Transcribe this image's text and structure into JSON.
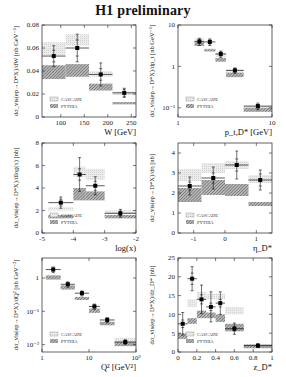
{
  "title": "H1 preliminary",
  "legend": {
    "cascade": "CASCADE",
    "pythia": "PYTHIA"
  },
  "colors": {
    "cascade": "#e4e4e4",
    "pythia": "#9a9a9a",
    "data": "#000000",
    "frame": "#222222"
  },
  "chart_data": [
    {
      "type": "bar",
      "id": "W",
      "title": "",
      "xlabel": "W [GeV]",
      "ylabel": "dσ_vis(ep→D*X)/dW [nb GeV⁻¹]",
      "xlim": [
        60,
        260
      ],
      "ylim": [
        0,
        0.08
      ],
      "xscale": "linear",
      "yscale": "linear",
      "xticks": [
        100,
        150,
        200,
        250
      ],
      "yticks": [
        0,
        0.02,
        0.04,
        0.06,
        0.08
      ],
      "bins": [
        [
          60,
          110
        ],
        [
          110,
          160
        ],
        [
          160,
          210
        ],
        [
          210,
          260
        ]
      ],
      "data": [
        0.053,
        0.06,
        0.037,
        0.021
      ],
      "stat_err": [
        0.005,
        0.007,
        0.005,
        0.003
      ],
      "tot_err": [
        0.009,
        0.012,
        0.01,
        0.004
      ],
      "cascade": [
        [
          0.054,
          0.065
        ],
        [
          0.062,
          0.072
        ],
        [
          0.035,
          0.04
        ],
        [
          0.019,
          0.022
        ]
      ],
      "pythia": [
        [
          0.033,
          0.045
        ],
        [
          0.035,
          0.046
        ],
        [
          0.023,
          0.029
        ],
        [
          0.011,
          0.013
        ]
      ],
      "legend_position": "lower-left"
    },
    {
      "type": "bar",
      "id": "pt",
      "xlabel": "p_t,D* [GeV]",
      "ylabel": "dσ_vis(ep→D*X)/dp_t [nb GeV⁻¹]",
      "xlim": [
        1,
        10
      ],
      "ylim": [
        0.06,
        10
      ],
      "xscale": "log",
      "yscale": "log",
      "xticks": [
        1,
        10
      ],
      "yticks": [
        0.1,
        1,
        10
      ],
      "ytick_labels": [
        "10⁻¹",
        "1",
        "10"
      ],
      "bins": [
        [
          1.5,
          1.9
        ],
        [
          1.9,
          2.5
        ],
        [
          2.5,
          3.25
        ],
        [
          3.25,
          5.0
        ],
        [
          5.0,
          10.0
        ]
      ],
      "data": [
        4.0,
        3.9,
        2.0,
        0.8,
        0.11
      ],
      "stat_err": [
        0.4,
        0.4,
        0.2,
        0.07,
        0.01
      ],
      "tot_err": [
        0.8,
        0.7,
        0.35,
        0.12,
        0.02
      ],
      "cascade": [
        [
          3.8,
          4.8
        ],
        [
          2.3,
          2.7
        ],
        [
          1.7,
          2.1
        ],
        [
          0.65,
          0.85
        ],
        [
          0.09,
          0.11
        ]
      ],
      "pythia": [
        [
          3.1,
          3.9
        ],
        [
          2.3,
          2.6
        ],
        [
          1.3,
          1.6
        ],
        [
          0.55,
          0.7
        ],
        [
          0.08,
          0.1
        ]
      ],
      "legend_position": "lower-left"
    },
    {
      "type": "bar",
      "id": "logx",
      "xlabel": "log(x)",
      "ylabel": "dσ_vis(ep→D*X)/dlog(x) [nb]",
      "xlim": [
        -5,
        -2
      ],
      "ylim": [
        0,
        8
      ],
      "xscale": "linear",
      "yscale": "linear",
      "xticks": [
        -5,
        -4,
        -3,
        -2
      ],
      "yticks": [
        0,
        2,
        4,
        6,
        8
      ],
      "bins": [
        [
          -4.8,
          -4.0
        ],
        [
          -4.0,
          -3.6
        ],
        [
          -3.6,
          -3.0
        ],
        [
          -3.0,
          -2.0
        ]
      ],
      "data": [
        2.7,
        5.2,
        4.2,
        1.75
      ],
      "stat_err": [
        0.3,
        0.5,
        0.4,
        0.2
      ],
      "tot_err": [
        0.5,
        1.5,
        0.8,
        0.35
      ],
      "cascade": [
        [
          2.0,
          2.3
        ],
        [
          5.0,
          5.9
        ],
        [
          4.7,
          5.7
        ],
        [
          1.7,
          2.0
        ]
      ],
      "pythia": [
        [
          1.3,
          1.6
        ],
        [
          2.9,
          4.0
        ],
        [
          2.9,
          3.7
        ],
        [
          1.3,
          1.6
        ]
      ],
      "legend_position": "lower-left"
    },
    {
      "type": "bar",
      "id": "eta",
      "xlabel": "η_D*",
      "ylabel": "dσ_vis(ep→D*X)/dη [nb]",
      "xlim": [
        -1.5,
        1.5
      ],
      "ylim": [
        0,
        4.5
      ],
      "xscale": "linear",
      "yscale": "linear",
      "xticks": [
        -1,
        0,
        1
      ],
      "yticks": [
        0,
        1,
        2,
        3,
        4
      ],
      "bins": [
        [
          -1.5,
          -0.75
        ],
        [
          -0.75,
          0.0
        ],
        [
          0.0,
          0.75
        ],
        [
          0.75,
          1.5
        ]
      ],
      "data": [
        2.35,
        2.75,
        3.4,
        2.65
      ],
      "stat_err": [
        0.2,
        0.25,
        0.3,
        0.3
      ],
      "tot_err": [
        0.45,
        0.55,
        0.7,
        0.5
      ],
      "cascade": [
        [
          2.6,
          3.2
        ],
        [
          3.0,
          3.5
        ],
        [
          3.2,
          3.6
        ],
        [
          2.5,
          2.9
        ]
      ],
      "pythia": [
        [
          1.55,
          2.25
        ],
        [
          1.9,
          2.65
        ],
        [
          1.85,
          2.45
        ],
        [
          1.35,
          1.55
        ]
      ],
      "legend_position": "lower-left"
    },
    {
      "type": "bar",
      "id": "Q2",
      "xlabel": "Q² [GeV²]",
      "ylabel": "dσ_vis(ep→D*X)/dQ² [nb GeV⁻²]",
      "xlim": [
        1,
        100
      ],
      "ylim": [
        0.006,
        4
      ],
      "xscale": "log",
      "yscale": "log",
      "xticks": [
        1,
        10,
        100
      ],
      "xtick_labels": [
        "1",
        "10",
        "10²"
      ],
      "yticks": [
        0.01,
        0.1,
        1
      ],
      "ytick_labels": [
        "10⁻²",
        "10⁻¹",
        "1"
      ],
      "bins": [
        [
          1.2,
          2.5
        ],
        [
          2.5,
          5
        ],
        [
          5,
          10
        ],
        [
          10,
          17
        ],
        [
          17,
          35
        ],
        [
          35,
          100
        ]
      ],
      "data": [
        1.8,
        0.65,
        0.35,
        0.14,
        0.055,
        0.012
      ],
      "stat_err": [
        0.15,
        0.05,
        0.03,
        0.012,
        0.005,
        0.001
      ],
      "tot_err": [
        0.35,
        0.12,
        0.06,
        0.025,
        0.01,
        0.002
      ],
      "cascade": [
        [
          1.0,
          1.2
        ],
        [
          0.5,
          0.6
        ],
        [
          0.22,
          0.27
        ],
        [
          0.1,
          0.12
        ],
        [
          0.04,
          0.05
        ],
        [
          0.011,
          0.016
        ]
      ],
      "pythia": [
        [
          0.9,
          1.2
        ],
        [
          0.45,
          0.6
        ],
        [
          0.22,
          0.27
        ],
        [
          0.09,
          0.12
        ],
        [
          0.038,
          0.048
        ],
        [
          0.009,
          0.012
        ]
      ],
      "legend_position": "lower-left"
    },
    {
      "type": "bar",
      "id": "z",
      "xlabel": "z_D*",
      "ylabel": "dσ_vis(ep→D*X)/dz_D* [nb]",
      "xlim": [
        0,
        1
      ],
      "ylim": [
        0,
        25
      ],
      "xscale": "linear",
      "yscale": "linear",
      "xticks": [
        0,
        0.2,
        0.4,
        0.6,
        0.8,
        1
      ],
      "yticks": [
        0,
        5,
        10,
        15,
        20,
        25
      ],
      "bins": [
        [
          0,
          0.1
        ],
        [
          0.1,
          0.2
        ],
        [
          0.2,
          0.3
        ],
        [
          0.3,
          0.4
        ],
        [
          0.4,
          0.5
        ],
        [
          0.5,
          0.7
        ],
        [
          0.7,
          1.0
        ]
      ],
      "data": [
        7.5,
        19.5,
        14.0,
        12.0,
        13.0,
        6.2,
        1.7
      ],
      "stat_err": [
        1.0,
        1.5,
        1.2,
        1.0,
        1.0,
        0.6,
        0.3
      ],
      "tot_err": [
        3.0,
        3.2,
        3.8,
        4.0,
        3.0,
        1.5,
        0.5
      ],
      "cascade": [
        [
          4.0,
          5.0
        ],
        [
          12.0,
          14.0
        ],
        [
          14.0,
          16.0
        ],
        [
          14.0,
          15.5
        ],
        [
          14.0,
          15.5
        ],
        [
          10.0,
          12.0
        ],
        [
          1.5,
          2.0
        ]
      ],
      "pythia": [
        [
          3.5,
          5.0
        ],
        [
          7.5,
          9.0
        ],
        [
          9.0,
          11.0
        ],
        [
          9.0,
          10.5
        ],
        [
          8.0,
          10.0
        ],
        [
          5.5,
          7.5
        ],
        [
          1.0,
          2.0
        ]
      ],
      "legend_position": "lower-left"
    }
  ]
}
